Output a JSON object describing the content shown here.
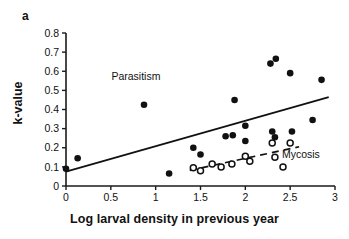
{
  "panel": {
    "letter": "a"
  },
  "axes": {
    "xlabel": "Log larval density in previous year",
    "ylabel": "k-value",
    "x_ticks": [
      "0",
      "0.5",
      "1",
      "1.5",
      "2",
      "2.5",
      "3"
    ],
    "y_ticks": [
      "0",
      "0.1",
      "0.2",
      "0.3",
      "0.4",
      "0.5",
      "0.6",
      "0.7",
      "0.8"
    ]
  },
  "annotations": {
    "parasitism": "Parasitism",
    "mycosis": "Mycosis"
  },
  "colors": {
    "axis": "#1a1a1a",
    "filled_marker": "#111111",
    "open_marker_fill": "#ffffff",
    "open_marker_stroke": "#111111",
    "background": "#ffffff"
  },
  "chart_data": {
    "type": "scatter",
    "title": "",
    "panel_label": "a",
    "xlabel": "Log larval density in previous year",
    "ylabel": "k-value",
    "xlim": [
      0,
      3
    ],
    "ylim": [
      0,
      0.8
    ],
    "x_tick_values": [
      0,
      0.5,
      1,
      1.5,
      2,
      2.5,
      3
    ],
    "y_tick_values": [
      0,
      0.1,
      0.2,
      0.3,
      0.4,
      0.5,
      0.6,
      0.7,
      0.8
    ],
    "grid": false,
    "legend": "in-plot text annotations",
    "series": [
      {
        "name": "Parasitism",
        "marker": "filled-circle",
        "label_position": {
          "x": 0.78,
          "y": 0.555
        },
        "points": [
          {
            "x": 0.0,
            "y": 0.09
          },
          {
            "x": 0.13,
            "y": 0.145
          },
          {
            "x": 0.87,
            "y": 0.425
          },
          {
            "x": 1.15,
            "y": 0.065
          },
          {
            "x": 1.42,
            "y": 0.2
          },
          {
            "x": 1.5,
            "y": 0.165
          },
          {
            "x": 1.78,
            "y": 0.26
          },
          {
            "x": 1.86,
            "y": 0.265
          },
          {
            "x": 1.88,
            "y": 0.45
          },
          {
            "x": 2.0,
            "y": 0.235
          },
          {
            "x": 2.0,
            "y": 0.315
          },
          {
            "x": 2.28,
            "y": 0.64
          },
          {
            "x": 2.34,
            "y": 0.665
          },
          {
            "x": 2.3,
            "y": 0.285
          },
          {
            "x": 2.33,
            "y": 0.255
          },
          {
            "x": 2.5,
            "y": 0.59
          },
          {
            "x": 2.52,
            "y": 0.285
          },
          {
            "x": 2.75,
            "y": 0.345
          },
          {
            "x": 2.85,
            "y": 0.555
          }
        ],
        "fit_line": {
          "style": "solid",
          "x_start": 0.0,
          "y_start": 0.075,
          "x_end": 2.93,
          "y_end": 0.465
        }
      },
      {
        "name": "Mycosis",
        "marker": "open-circle",
        "label_position": {
          "x": 2.62,
          "y": 0.145
        },
        "points": [
          {
            "x": 1.42,
            "y": 0.095
          },
          {
            "x": 1.5,
            "y": 0.08
          },
          {
            "x": 1.63,
            "y": 0.115
          },
          {
            "x": 1.73,
            "y": 0.1
          },
          {
            "x": 1.85,
            "y": 0.115
          },
          {
            "x": 2.0,
            "y": 0.155
          },
          {
            "x": 2.05,
            "y": 0.13
          },
          {
            "x": 2.3,
            "y": 0.225
          },
          {
            "x": 2.33,
            "y": 0.15
          },
          {
            "x": 2.42,
            "y": 0.1
          },
          {
            "x": 2.5,
            "y": 0.225
          }
        ],
        "fit_line": {
          "style": "dashed",
          "x_start": 1.38,
          "y_start": 0.082,
          "x_end": 2.6,
          "y_end": 0.205
        }
      }
    ]
  }
}
